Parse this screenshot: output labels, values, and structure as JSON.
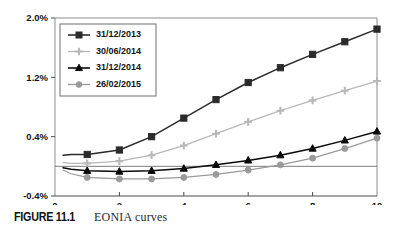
{
  "figure": {
    "label": "FIGURE 11.1",
    "caption": "EONIA curves"
  },
  "chart_data": {
    "type": "line",
    "title": "EONIA curves",
    "xlabel": "",
    "ylabel": "",
    "xlim": [
      0,
      10
    ],
    "ylim": [
      -0.4,
      2.0
    ],
    "xticks": [
      0,
      2,
      4,
      6,
      8,
      10
    ],
    "yticks": [
      -0.4,
      0.4,
      1.2,
      2.0
    ],
    "xtick_labels": [
      "0",
      "2",
      "4",
      "6",
      "8",
      "10"
    ],
    "ytick_labels": [
      "-0.4%",
      "0.4%",
      "1.2%",
      "2.0%"
    ],
    "grid": false,
    "zero_line": true,
    "legend_position": "upper left (inside)",
    "x": [
      0.25,
      0.5,
      1,
      2,
      3,
      4,
      5,
      6,
      7,
      8,
      9,
      10
    ],
    "series": [
      {
        "name": "31/12/2013",
        "color": "#2b2b2b",
        "marker": "square",
        "values": [
          0.15,
          0.16,
          0.16,
          0.22,
          0.4,
          0.65,
          0.9,
          1.13,
          1.33,
          1.51,
          1.68,
          1.85
        ]
      },
      {
        "name": "30/06/2014",
        "color": "#b8b8b8",
        "marker": "plus",
        "values": [
          0.05,
          0.04,
          0.04,
          0.07,
          0.15,
          0.28,
          0.44,
          0.6,
          0.75,
          0.89,
          1.02,
          1.15
        ]
      },
      {
        "name": "31/12/2014",
        "color": "#0a0a0a",
        "marker": "triangle",
        "values": [
          -0.02,
          -0.04,
          -0.06,
          -0.07,
          -0.06,
          -0.03,
          0.02,
          0.08,
          0.15,
          0.24,
          0.35,
          0.47
        ]
      },
      {
        "name": "26/02/2015",
        "color": "#9a9a9a",
        "marker": "circle",
        "values": [
          -0.05,
          -0.1,
          -0.15,
          -0.17,
          -0.17,
          -0.15,
          -0.11,
          -0.05,
          0.02,
          0.11,
          0.24,
          0.38
        ]
      }
    ]
  }
}
